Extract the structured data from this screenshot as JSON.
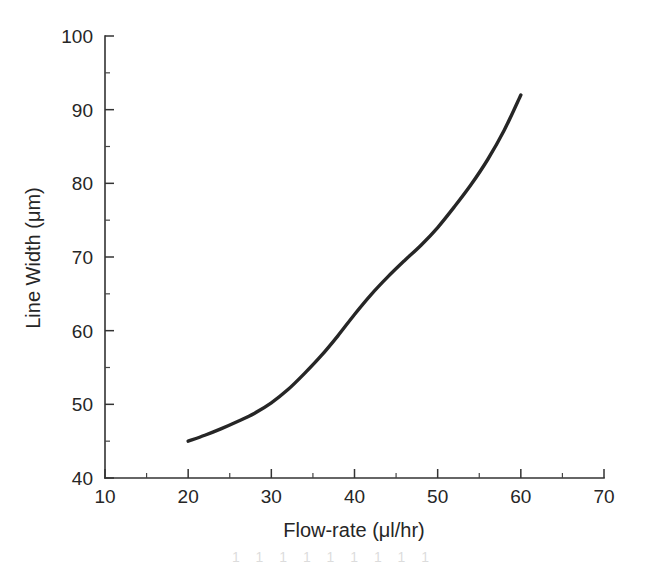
{
  "figure": {
    "background_color": "#ffffff",
    "ink_color": "#262626",
    "caption_fragment": "1 1 1 1 1 1 1 1 1"
  },
  "chart_data": {
    "type": "line",
    "title": "",
    "xlabel": "Flow-rate (μl/hr)",
    "ylabel": "Line Width (μm)",
    "xlim": [
      10,
      70
    ],
    "ylim": [
      40,
      100
    ],
    "xticks": [
      10,
      20,
      30,
      40,
      50,
      60,
      70
    ],
    "xtick_labels": [
      "10",
      "20",
      "30",
      "40",
      "50",
      "60",
      "70"
    ],
    "yticks": [
      40,
      50,
      60,
      70,
      80,
      90,
      100
    ],
    "ytick_labels": [
      "40",
      "50",
      "60",
      "70",
      "80",
      "90",
      "100"
    ],
    "x_minor_ticks": [
      15,
      25,
      35,
      45,
      55,
      65
    ],
    "y_minor_ticks": [
      45,
      55,
      65,
      75,
      85,
      95
    ],
    "grid": false,
    "legend": false,
    "legend_position": "none",
    "series": [
      {
        "name": "Line width vs flow-rate",
        "color": "#262626",
        "x": [
          20,
          22,
          24,
          26,
          28,
          30,
          32,
          34,
          36,
          38,
          40,
          42,
          44,
          46,
          48,
          50,
          52,
          54,
          56,
          58,
          60
        ],
        "values": [
          45.0,
          45.8,
          46.7,
          47.7,
          48.8,
          50.2,
          52.0,
          54.2,
          56.6,
          59.3,
          62.2,
          64.9,
          67.3,
          69.5,
          71.6,
          74.0,
          76.8,
          79.8,
          83.2,
          87.2,
          92.0
        ]
      }
    ],
    "annotations": []
  },
  "axes": {
    "x_axis_name": "flow-rate-axis",
    "y_axis_name": "line-width-axis"
  }
}
